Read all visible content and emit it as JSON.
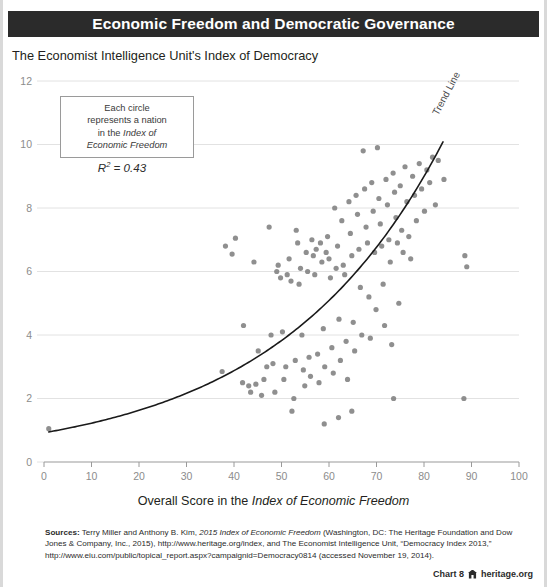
{
  "header": {
    "title": "Economic Freedom and Democratic Governance"
  },
  "subtitle": "The Economist Intelligence Unit's Index of Democracy",
  "callout": {
    "line1": "Each circle",
    "line2": "represents a nation",
    "line3": "in the ",
    "line3_italic": "Index of",
    "line4_italic": "Economic Freedom",
    "r2_prefix": "R",
    "r2_sup": "2",
    "r2_value": " = 0.43"
  },
  "trend_label": "Trend Line",
  "axis_title": {
    "prefix": "Overall Score in the ",
    "italic": "Index of Economic Freedom"
  },
  "sources": {
    "label": "Sources:",
    "text": " Terry Miller and Anthony B. Kim, ",
    "italic1": "2015 Index of Economic Freedom",
    "text2": " (Washington, DC: The Heritage Foundation and Dow Jones & Company, Inc., 2015), http://www.heritage.org/index, and The Economist Intelligence Unit, “Democracy Index 2013,” http://www.eiu.com/public/topical_report.aspx?campaignid=Democracy0814 (accessed November 19, 2014)."
  },
  "footer": {
    "chart_number": "Chart 8",
    "site": "heritage.org",
    "logo": "heritage-castle-icon"
  },
  "colors": {
    "header_bar": "#2b2b2b",
    "point": "#7f7f7f",
    "trend_line": "#1a1a1a",
    "gridline": "#e2e2e2",
    "axis": "#9a9a9a",
    "tick_text": "#8c8c8c"
  },
  "chart_data": {
    "type": "scatter",
    "title": "Economic Freedom and Democratic Governance",
    "xlabel": "Overall Score in the Index of Economic Freedom",
    "ylabel": "The Economist Intelligence Unit's Index of Democracy",
    "xlim": [
      0,
      100
    ],
    "ylim": [
      0,
      12
    ],
    "xticks": [
      0,
      10,
      20,
      30,
      40,
      50,
      60,
      70,
      80,
      90,
      100
    ],
    "yticks": [
      0,
      2,
      4,
      6,
      8,
      10,
      12
    ],
    "grid": "horizontal",
    "legend": "none",
    "r_squared": 0.43,
    "annotations": [
      "Each circle represents a nation in the Index of Economic Freedom",
      "R² = 0.43",
      "Trend Line"
    ],
    "trend": {
      "kind": "exponential",
      "label": "Trend Line",
      "a": 0.92,
      "b": 0.0285,
      "x_from": 1,
      "x_to": 84
    },
    "points": [
      [
        1.0,
        1.05
      ],
      [
        37.5,
        2.85
      ],
      [
        38.2,
        6.8
      ],
      [
        39.6,
        6.55
      ],
      [
        40.3,
        7.05
      ],
      [
        41.8,
        2.5
      ],
      [
        42.0,
        4.3
      ],
      [
        43.1,
        2.4
      ],
      [
        43.5,
        2.2
      ],
      [
        44.2,
        6.3
      ],
      [
        44.6,
        2.45
      ],
      [
        45.1,
        3.5
      ],
      [
        45.8,
        2.1
      ],
      [
        46.3,
        2.6
      ],
      [
        46.9,
        3.0
      ],
      [
        47.4,
        7.4
      ],
      [
        47.8,
        4.0
      ],
      [
        48.2,
        3.1
      ],
      [
        48.6,
        2.2
      ],
      [
        49.0,
        6.0
      ],
      [
        49.3,
        6.2
      ],
      [
        49.8,
        5.8
      ],
      [
        50.2,
        4.1
      ],
      [
        50.5,
        2.6
      ],
      [
        50.9,
        3.0
      ],
      [
        51.2,
        5.9
      ],
      [
        51.6,
        6.4
      ],
      [
        52.0,
        5.7
      ],
      [
        52.2,
        1.6
      ],
      [
        52.6,
        2.0
      ],
      [
        52.9,
        3.2
      ],
      [
        53.1,
        7.3
      ],
      [
        53.4,
        6.9
      ],
      [
        53.7,
        5.6
      ],
      [
        54.0,
        6.1
      ],
      [
        54.3,
        4.0
      ],
      [
        54.6,
        2.9
      ],
      [
        54.9,
        2.4
      ],
      [
        55.2,
        6.6
      ],
      [
        55.5,
        6.0
      ],
      [
        55.8,
        3.3
      ],
      [
        56.1,
        2.7
      ],
      [
        56.4,
        7.0
      ],
      [
        56.7,
        6.5
      ],
      [
        57.0,
        5.9
      ],
      [
        57.3,
        6.7
      ],
      [
        57.6,
        3.4
      ],
      [
        57.9,
        2.5
      ],
      [
        58.2,
        6.9
      ],
      [
        58.5,
        6.3
      ],
      [
        58.8,
        4.2
      ],
      [
        59.1,
        3.0
      ],
      [
        59.4,
        6.6
      ],
      [
        59.7,
        7.1
      ],
      [
        60.0,
        6.4
      ],
      [
        60.3,
        5.8
      ],
      [
        60.6,
        3.6
      ],
      [
        60.9,
        2.8
      ],
      [
        61.2,
        8.0
      ],
      [
        61.5,
        6.1
      ],
      [
        61.8,
        6.8
      ],
      [
        62.1,
        4.5
      ],
      [
        62.4,
        3.2
      ],
      [
        62.7,
        7.6
      ],
      [
        63.0,
        6.2
      ],
      [
        63.3,
        5.9
      ],
      [
        63.6,
        3.8
      ],
      [
        63.9,
        2.6
      ],
      [
        64.2,
        8.2
      ],
      [
        64.5,
        7.2
      ],
      [
        64.8,
        6.5
      ],
      [
        65.1,
        4.4
      ],
      [
        65.4,
        3.5
      ],
      [
        65.7,
        8.4
      ],
      [
        66.0,
        7.8
      ],
      [
        66.3,
        6.7
      ],
      [
        66.6,
        5.5
      ],
      [
        66.9,
        4.0
      ],
      [
        67.2,
        9.8
      ],
      [
        67.5,
        8.6
      ],
      [
        67.8,
        7.4
      ],
      [
        68.1,
        6.9
      ],
      [
        68.4,
        5.2
      ],
      [
        68.7,
        3.9
      ],
      [
        69.0,
        8.8
      ],
      [
        69.3,
        7.9
      ],
      [
        69.6,
        6.6
      ],
      [
        69.9,
        4.8
      ],
      [
        70.2,
        9.9
      ],
      [
        70.5,
        8.3
      ],
      [
        70.8,
        7.5
      ],
      [
        71.1,
        6.8
      ],
      [
        71.4,
        5.6
      ],
      [
        71.7,
        4.3
      ],
      [
        72.0,
        8.9
      ],
      [
        72.3,
        8.1
      ],
      [
        72.6,
        7.0
      ],
      [
        72.9,
        6.3
      ],
      [
        73.2,
        3.7
      ],
      [
        73.5,
        9.1
      ],
      [
        73.8,
        8.5
      ],
      [
        74.1,
        7.7
      ],
      [
        74.4,
        6.9
      ],
      [
        74.7,
        5.0
      ],
      [
        75.0,
        8.7
      ],
      [
        75.3,
        7.3
      ],
      [
        75.6,
        6.6
      ],
      [
        76.0,
        9.3
      ],
      [
        76.4,
        8.2
      ],
      [
        76.8,
        7.1
      ],
      [
        77.2,
        6.4
      ],
      [
        77.6,
        9.0
      ],
      [
        78.0,
        8.4
      ],
      [
        78.4,
        7.6
      ],
      [
        79.0,
        9.4
      ],
      [
        79.5,
        8.6
      ],
      [
        80.1,
        7.9
      ],
      [
        80.6,
        9.2
      ],
      [
        81.2,
        8.8
      ],
      [
        81.8,
        9.6
      ],
      [
        82.4,
        8.1
      ],
      [
        83.0,
        9.5
      ],
      [
        84.2,
        8.9
      ],
      [
        88.6,
        6.5
      ],
      [
        89.0,
        6.15
      ],
      [
        88.4,
        2.0
      ],
      [
        73.6,
        2.0
      ],
      [
        64.8,
        1.6
      ],
      [
        62.0,
        1.4
      ],
      [
        59.0,
        1.2
      ]
    ]
  }
}
